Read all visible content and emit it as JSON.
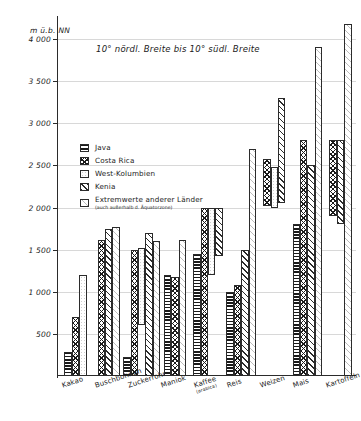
{
  "chart_data": {
    "type": "bar",
    "title": "",
    "subtitle": "10° nördl. Breite bis 10° südl. Breite",
    "ylabel": "m ü.b. NN",
    "xlabel": "",
    "ylim": [
      0,
      4250
    ],
    "yticks": [
      500,
      1000,
      1500,
      2000,
      2500,
      3000,
      3500,
      4000
    ],
    "ytick_labels": [
      "500",
      "1 000",
      "1 500",
      "2 000",
      "2 500",
      "3 000",
      "3 500",
      "4 000"
    ],
    "grid": true,
    "legend_position": "upper-left-inside",
    "categories": [
      "Kakao",
      "Buschbohnen",
      "Zuckerrohr",
      "Maniok",
      "Kaffee",
      "Reis",
      "Weizen",
      "Mais",
      "Kartoffeln"
    ],
    "category_notes": [
      "",
      "",
      "",
      "",
      "(arabica)",
      "",
      "",
      "",
      ""
    ],
    "series": [
      {
        "name": "Java",
        "pattern": "horizontal-lines",
        "bars": [
          {
            "category": "Kakao",
            "low": 0,
            "high": 280
          },
          {
            "category": "Buschbohnen",
            "low": null,
            "high": null
          },
          {
            "category": "Zuckerrohr",
            "low": 0,
            "high": 230
          },
          {
            "category": "Maniok",
            "low": 0,
            "high": 1200
          },
          {
            "category": "Kaffee",
            "low": 0,
            "high": 1450
          },
          {
            "category": "Reis",
            "low": 0,
            "high": 1000
          },
          {
            "category": "Weizen",
            "low": null,
            "high": null
          },
          {
            "category": "Mais",
            "low": 0,
            "high": 1800
          },
          {
            "category": "Kartoffeln",
            "low": null,
            "high": null
          }
        ]
      },
      {
        "name": "Costa Rica",
        "pattern": "cross-hatch",
        "bars": [
          {
            "category": "Kakao",
            "low": 0,
            "high": 700
          },
          {
            "category": "Buschbohnen",
            "low": 0,
            "high": 1620
          },
          {
            "category": "Zuckerrohr",
            "low": 0,
            "high": 1500
          },
          {
            "category": "Maniok",
            "low": 0,
            "high": 1180
          },
          {
            "category": "Kaffee",
            "low": 0,
            "high": 2000
          },
          {
            "category": "Reis",
            "low": 0,
            "high": 1080
          },
          {
            "category": "Weizen",
            "low": 2020,
            "high": 2580
          },
          {
            "category": "Mais",
            "low": 0,
            "high": 2800
          },
          {
            "category": "Kartoffeln",
            "low": 1900,
            "high": 2800
          }
        ]
      },
      {
        "name": "West-Kolumbien",
        "pattern": "plain-dotted",
        "bars": [
          {
            "category": "Kakao",
            "low": 0,
            "high": 1200
          },
          {
            "category": "Buschbohnen",
            "low": null,
            "high": null
          },
          {
            "category": "Zuckerrohr",
            "low": 600,
            "high": 1520
          },
          {
            "category": "Maniok",
            "low": null,
            "high": null
          },
          {
            "category": "Kaffee",
            "low": 1200,
            "high": 2000
          },
          {
            "category": "Reis",
            "low": null,
            "high": null
          },
          {
            "category": "Weizen",
            "low": 2000,
            "high": 2480
          },
          {
            "category": "Mais",
            "low": null,
            "high": null
          },
          {
            "category": "Kartoffeln",
            "low": null,
            "high": null
          }
        ]
      },
      {
        "name": "Kenia",
        "pattern": "diagonal-hatch",
        "bars": [
          {
            "category": "Kakao",
            "low": null,
            "high": null
          },
          {
            "category": "Buschbohnen",
            "low": 0,
            "high": 1750
          },
          {
            "category": "Zuckerrohr",
            "low": 0,
            "high": 1700
          },
          {
            "category": "Maniok",
            "low": null,
            "high": null
          },
          {
            "category": "Kaffee",
            "low": 1430,
            "high": 2000
          },
          {
            "category": "Reis",
            "low": 0,
            "high": 1500
          },
          {
            "category": "Weizen",
            "low": 2050,
            "high": 3300
          },
          {
            "category": "Mais",
            "low": 0,
            "high": 2500
          },
          {
            "category": "Kartoffeln",
            "low": 1800,
            "high": 2800
          }
        ]
      },
      {
        "name": "Extremwerte anderer Länder",
        "pattern": "light-diagonal",
        "bars": [
          {
            "category": "Kakao",
            "low": null,
            "high": null
          },
          {
            "category": "Buschbohnen",
            "low": 0,
            "high": 1770
          },
          {
            "category": "Zuckerrohr",
            "low": 0,
            "high": 1600
          },
          {
            "category": "Maniok",
            "low": 0,
            "high": 1620
          },
          {
            "category": "Kaffee",
            "low": null,
            "high": null
          },
          {
            "category": "Reis",
            "low": 0,
            "high": 2700
          },
          {
            "category": "Weizen",
            "low": null,
            "high": null
          },
          {
            "category": "Mais",
            "low": 0,
            "high": 3900
          },
          {
            "category": "Kartoffeln",
            "low": 0,
            "high": 4180
          }
        ]
      }
    ]
  },
  "legend": {
    "items": [
      {
        "label": "Java",
        "note": "",
        "pattern": "p-java"
      },
      {
        "label": "Costa Rica",
        "note": "",
        "pattern": "p-costarica"
      },
      {
        "label": "West-Kolumbien",
        "note": "",
        "pattern": "p-westkol"
      },
      {
        "label": "Kenia",
        "note": "",
        "pattern": "p-kenia"
      },
      {
        "label": "Extremwerte anderer Länder",
        "note": "(auch außerhalb d. Äquatorzone)",
        "pattern": "p-extrem"
      }
    ]
  }
}
